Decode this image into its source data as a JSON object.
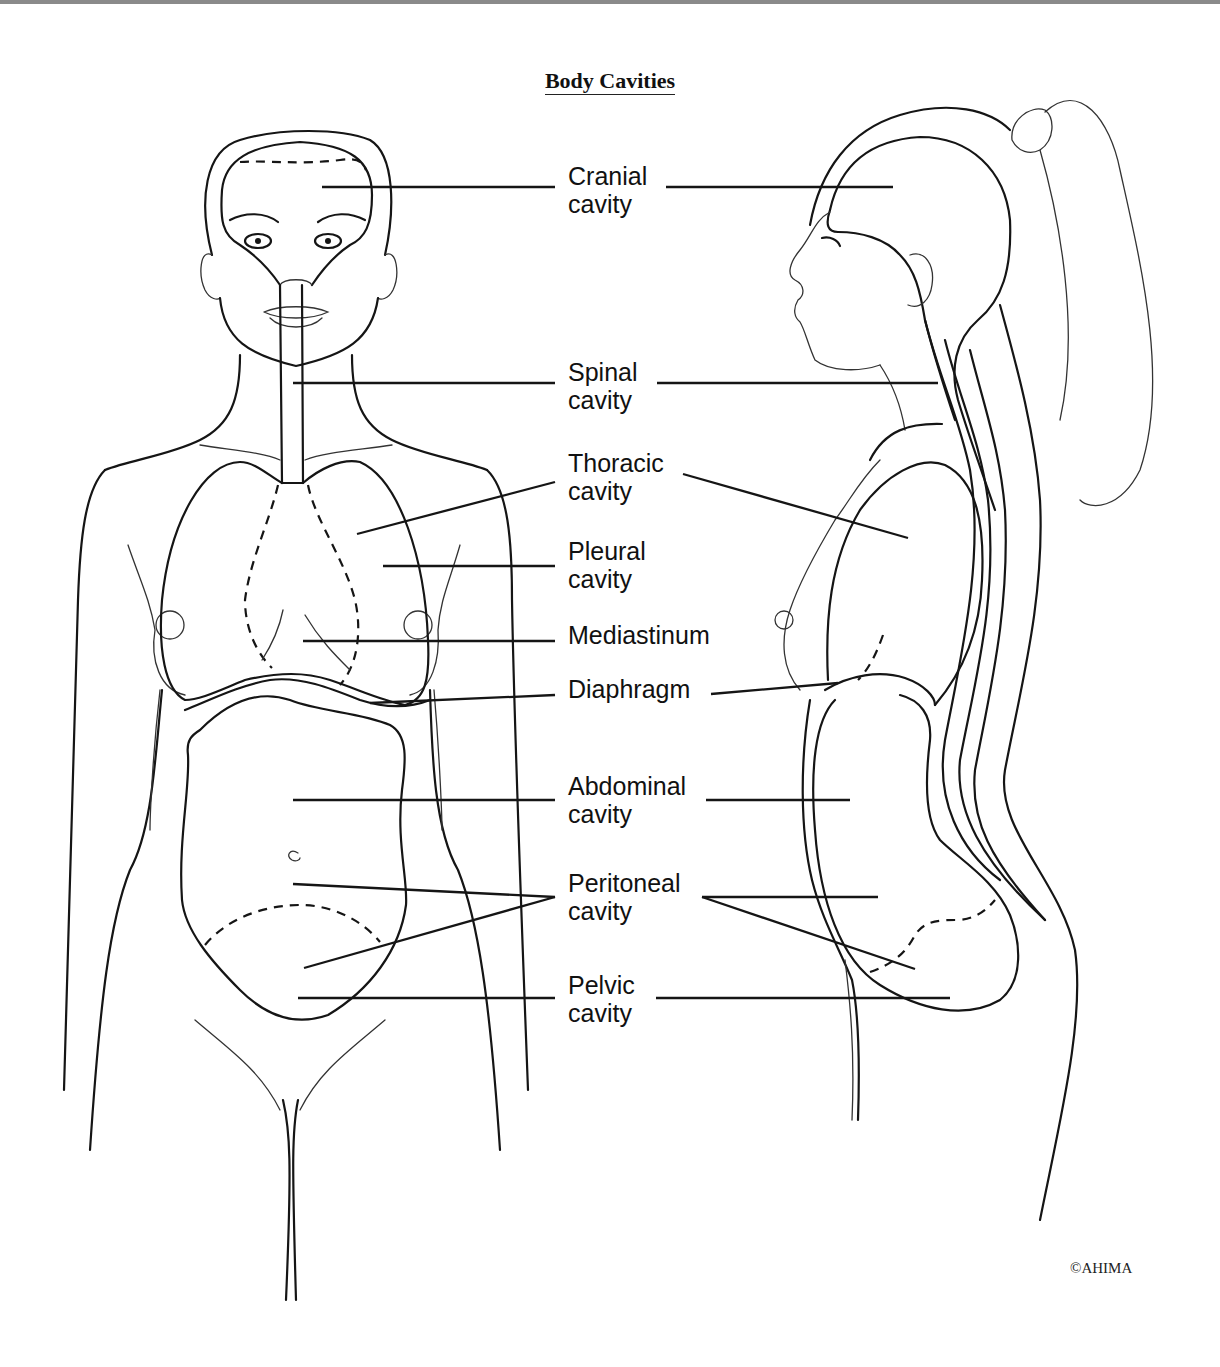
{
  "title": "Body Cavities",
  "copyright": "©AHIMA",
  "colors": {
    "line": "#151515",
    "background": "#ffffff",
    "top_rule": "#8a8a8a"
  },
  "views": [
    "anterior-view",
    "lateral-view"
  ],
  "labels": [
    {
      "id": "cranial",
      "line1": "Cranial",
      "line2": "cavity",
      "x": 568,
      "y": 185,
      "leaders": [
        {
          "x1": 555,
          "y1": 187,
          "x2": 322,
          "y2": 187
        },
        {
          "x1": 666,
          "y1": 187,
          "x2": 893,
          "y2": 187
        }
      ]
    },
    {
      "id": "spinal",
      "line1": "Spinal",
      "line2": "cavity",
      "x": 568,
      "y": 381,
      "leaders": [
        {
          "x1": 555,
          "y1": 383,
          "x2": 293,
          "y2": 383
        },
        {
          "x1": 657,
          "y1": 383,
          "x2": 938,
          "y2": 383
        }
      ]
    },
    {
      "id": "thoracic",
      "line1": "Thoracic",
      "line2": "cavity",
      "x": 568,
      "y": 472,
      "leaders": [
        {
          "x1": 555,
          "y1": 482,
          "x2": 357,
          "y2": 534
        },
        {
          "x1": 683,
          "y1": 474,
          "x2": 908,
          "y2": 538
        }
      ]
    },
    {
      "id": "pleural",
      "line1": "Pleural",
      "line2": "cavity",
      "x": 568,
      "y": 560,
      "leaders": [
        {
          "x1": 555,
          "y1": 566,
          "x2": 383,
          "y2": 566
        }
      ]
    },
    {
      "id": "mediastinum",
      "line1": "Mediastinum",
      "line2": "",
      "x": 568,
      "y": 644,
      "leaders": [
        {
          "x1": 555,
          "y1": 641,
          "x2": 303,
          "y2": 641
        }
      ]
    },
    {
      "id": "diaphragm",
      "line1": "Diaphragm",
      "line2": "",
      "x": 568,
      "y": 698,
      "leaders": [
        {
          "x1": 555,
          "y1": 695,
          "x2": 370,
          "y2": 703
        },
        {
          "x1": 711,
          "y1": 694,
          "x2": 838,
          "y2": 683
        }
      ]
    },
    {
      "id": "abdominal",
      "line1": "Abdominal",
      "line2": "cavity",
      "x": 568,
      "y": 795,
      "leaders": [
        {
          "x1": 555,
          "y1": 800,
          "x2": 293,
          "y2": 800
        },
        {
          "x1": 706,
          "y1": 800,
          "x2": 850,
          "y2": 800
        }
      ]
    },
    {
      "id": "peritoneal",
      "line1": "Peritoneal",
      "line2": "cavity",
      "x": 568,
      "y": 892,
      "leaders": [
        {
          "x1": 555,
          "y1": 897,
          "x2": 293,
          "y2": 884
        },
        {
          "x1": 555,
          "y1": 897,
          "x2": 304,
          "y2": 968
        },
        {
          "x1": 702,
          "y1": 897,
          "x2": 878,
          "y2": 897
        },
        {
          "x1": 702,
          "y1": 897,
          "x2": 915,
          "y2": 969
        }
      ]
    },
    {
      "id": "pelvic",
      "line1": "Pelvic",
      "line2": "cavity",
      "x": 568,
      "y": 994,
      "leaders": [
        {
          "x1": 555,
          "y1": 998,
          "x2": 298,
          "y2": 998
        },
        {
          "x1": 656,
          "y1": 998,
          "x2": 950,
          "y2": 998
        }
      ]
    }
  ]
}
